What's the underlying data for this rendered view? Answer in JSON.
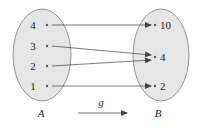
{
  "diagram": {
    "type": "function-mapping",
    "function_name": "g",
    "domain": {
      "name": "A",
      "elements": [
        "4",
        "3",
        "2",
        "1"
      ]
    },
    "codomain": {
      "name": "B",
      "elements": [
        "10",
        "4",
        "2"
      ]
    },
    "mappings": [
      {
        "from": "4",
        "to": "10"
      },
      {
        "from": "3",
        "to": "4"
      },
      {
        "from": "2",
        "to": "4"
      },
      {
        "from": "1",
        "to": "2"
      }
    ],
    "colors": {
      "set_fill": "#e6e6e6",
      "set_stroke": "#7a7a7a",
      "arrow": "#444444",
      "text": "#222222"
    }
  }
}
